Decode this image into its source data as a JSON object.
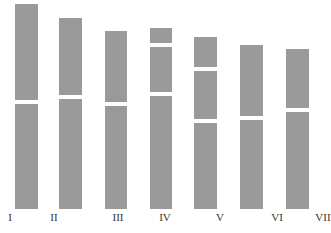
{
  "diagram": {
    "type": "karyogram-bars",
    "bar_color": "#9a9a9a",
    "background": "#ffffff",
    "bars": [
      {
        "label": "I",
        "x": 15,
        "w": 23,
        "segments": [
          [
            4,
            100
          ],
          [
            104,
            209
          ]
        ],
        "label_x": 10
      },
      {
        "label": "II",
        "x": 59,
        "w": 23,
        "segments": [
          [
            18,
            95
          ],
          [
            99,
            209
          ]
        ],
        "label_x": 54
      },
      {
        "label": "III",
        "x": 105,
        "w": 22,
        "segments": [
          [
            31,
            102
          ],
          [
            106,
            209
          ]
        ],
        "label_x": 118
      },
      {
        "label": "IV",
        "x": 150,
        "w": 22,
        "segments": [
          [
            28,
            43
          ],
          [
            47,
            92
          ],
          [
            96,
            209
          ]
        ],
        "label_x": 165
      },
      {
        "label": "V",
        "x": 194,
        "w": 23,
        "segments": [
          [
            37,
            67
          ],
          [
            71,
            119
          ],
          [
            123,
            209
          ]
        ],
        "label_x": 220
      },
      {
        "label": "VI",
        "x": 240,
        "w": 23,
        "segments": [
          [
            45,
            116
          ],
          [
            120,
            209
          ]
        ],
        "label_x": 277
      },
      {
        "label": "VII",
        "x": 286,
        "w": 23,
        "segments": [
          [
            49,
            108
          ],
          [
            112,
            209
          ]
        ],
        "label_x": 323
      }
    ]
  }
}
